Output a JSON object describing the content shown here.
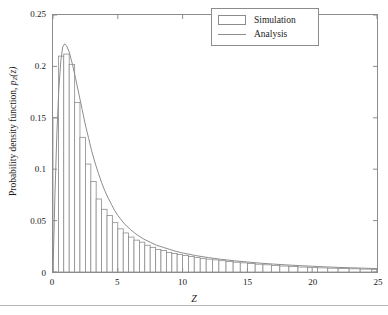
{
  "chart_data": {
    "type": "bar",
    "title": "",
    "subtitle": "",
    "xlabel": "Z",
    "ylabel": "Probability density function, p_Z(z)",
    "xlim": [
      0,
      25
    ],
    "ylim": [
      0,
      0.25
    ],
    "xticks": [
      0,
      5,
      10,
      15,
      20,
      25
    ],
    "xticklabels": [
      "0",
      "5",
      "10",
      "15",
      "20",
      "25"
    ],
    "yticks": [
      0,
      0.05,
      0.1,
      0.15,
      0.2,
      0.25
    ],
    "yticklabels": [
      "0",
      "0.05",
      "0.1",
      "0.15",
      "0.2",
      "0.25"
    ],
    "grid": false,
    "legend_position": "upper right",
    "legend": [
      "Simulation",
      "Analysis"
    ],
    "series": [
      {
        "name": "Simulation",
        "type": "bar",
        "style": "histogram-outline",
        "edge_color": "#8c8c8c",
        "fill_color": "#ffffff",
        "bins": [
          {
            "x0": 0.0,
            "x1": 0.42,
            "value": 0.15
          },
          {
            "x0": 0.42,
            "x1": 0.83,
            "value": 0.21
          },
          {
            "x0": 0.83,
            "x1": 1.25,
            "value": 0.212
          },
          {
            "x0": 1.25,
            "x1": 1.67,
            "value": 0.202
          },
          {
            "x0": 1.67,
            "x1": 2.08,
            "value": 0.165
          },
          {
            "x0": 2.08,
            "x1": 2.5,
            "value": 0.131
          },
          {
            "x0": 2.5,
            "x1": 2.92,
            "value": 0.105
          },
          {
            "x0": 2.92,
            "x1": 3.33,
            "value": 0.088
          },
          {
            "x0": 3.33,
            "x1": 3.75,
            "value": 0.071
          },
          {
            "x0": 3.75,
            "x1": 4.17,
            "value": 0.061
          },
          {
            "x0": 4.17,
            "x1": 4.58,
            "value": 0.055
          },
          {
            "x0": 4.58,
            "x1": 5.0,
            "value": 0.048
          },
          {
            "x0": 5.0,
            "x1": 5.42,
            "value": 0.042
          },
          {
            "x0": 5.42,
            "x1": 5.83,
            "value": 0.038
          },
          {
            "x0": 5.83,
            "x1": 6.25,
            "value": 0.034
          },
          {
            "x0": 6.25,
            "x1": 6.67,
            "value": 0.031
          },
          {
            "x0": 6.67,
            "x1": 7.08,
            "value": 0.029
          },
          {
            "x0": 7.08,
            "x1": 7.5,
            "value": 0.026
          },
          {
            "x0": 7.5,
            "x1": 7.92,
            "value": 0.024
          },
          {
            "x0": 7.92,
            "x1": 8.33,
            "value": 0.022
          },
          {
            "x0": 8.33,
            "x1": 8.75,
            "value": 0.021
          },
          {
            "x0": 8.75,
            "x1": 9.17,
            "value": 0.019
          },
          {
            "x0": 9.17,
            "x1": 9.58,
            "value": 0.018
          },
          {
            "x0": 9.58,
            "x1": 10.0,
            "value": 0.017
          },
          {
            "x0": 10.0,
            "x1": 10.45,
            "value": 0.016
          },
          {
            "x0": 10.45,
            "x1": 10.9,
            "value": 0.015
          },
          {
            "x0": 10.9,
            "x1": 11.36,
            "value": 0.014
          },
          {
            "x0": 11.36,
            "x1": 11.82,
            "value": 0.013
          },
          {
            "x0": 11.82,
            "x1": 12.3,
            "value": 0.0125
          },
          {
            "x0": 12.3,
            "x1": 12.8,
            "value": 0.0118
          },
          {
            "x0": 12.8,
            "x1": 13.35,
            "value": 0.011
          },
          {
            "x0": 13.35,
            "x1": 13.9,
            "value": 0.0102
          },
          {
            "x0": 13.9,
            "x1": 14.45,
            "value": 0.0095
          },
          {
            "x0": 14.45,
            "x1": 15.0,
            "value": 0.0089
          },
          {
            "x0": 15.0,
            "x1": 15.6,
            "value": 0.0082
          },
          {
            "x0": 15.6,
            "x1": 16.2,
            "value": 0.0076
          },
          {
            "x0": 16.2,
            "x1": 16.85,
            "value": 0.007
          },
          {
            "x0": 16.85,
            "x1": 17.5,
            "value": 0.0064
          },
          {
            "x0": 17.5,
            "x1": 18.2,
            "value": 0.0058
          },
          {
            "x0": 18.2,
            "x1": 18.9,
            "value": 0.0053
          },
          {
            "x0": 18.9,
            "x1": 19.65,
            "value": 0.0048
          },
          {
            "x0": 19.65,
            "x1": 20.4,
            "value": 0.0044
          },
          {
            "x0": 20.4,
            "x1": 21.2,
            "value": 0.004
          },
          {
            "x0": 21.2,
            "x1": 22.0,
            "value": 0.0037
          },
          {
            "x0": 22.0,
            "x1": 22.85,
            "value": 0.0034
          },
          {
            "x0": 22.85,
            "x1": 23.7,
            "value": 0.0031
          },
          {
            "x0": 23.7,
            "x1": 24.6,
            "value": 0.0028
          },
          {
            "x0": 24.6,
            "x1": 25.0,
            "value": 0.0026
          }
        ]
      },
      {
        "name": "Analysis",
        "type": "line",
        "color": "#8c8c8c",
        "points": [
          [
            0.0,
            0.0
          ],
          [
            0.15,
            0.075
          ],
          [
            0.3,
            0.135
          ],
          [
            0.45,
            0.178
          ],
          [
            0.6,
            0.205
          ],
          [
            0.75,
            0.219
          ],
          [
            0.9,
            0.222
          ],
          [
            1.05,
            0.22
          ],
          [
            1.25,
            0.214
          ],
          [
            1.5,
            0.202
          ],
          [
            1.75,
            0.188
          ],
          [
            2.0,
            0.173
          ],
          [
            2.25,
            0.158
          ],
          [
            2.5,
            0.143
          ],
          [
            2.75,
            0.13
          ],
          [
            3.0,
            0.117
          ],
          [
            3.25,
            0.106
          ],
          [
            3.5,
            0.096
          ],
          [
            3.75,
            0.087
          ],
          [
            4.0,
            0.079
          ],
          [
            4.25,
            0.072
          ],
          [
            4.5,
            0.066
          ],
          [
            4.75,
            0.06
          ],
          [
            5.0,
            0.055
          ],
          [
            5.5,
            0.047
          ],
          [
            6.0,
            0.041
          ],
          [
            6.5,
            0.036
          ],
          [
            7.0,
            0.032
          ],
          [
            7.5,
            0.029
          ],
          [
            8.0,
            0.026
          ],
          [
            8.5,
            0.024
          ],
          [
            9.0,
            0.022
          ],
          [
            9.5,
            0.02
          ],
          [
            10.0,
            0.0185
          ],
          [
            11.0,
            0.016
          ],
          [
            12.0,
            0.014
          ],
          [
            13.0,
            0.0123
          ],
          [
            14.0,
            0.0109
          ],
          [
            15.0,
            0.0097
          ],
          [
            16.0,
            0.0086
          ],
          [
            17.0,
            0.0077
          ],
          [
            18.0,
            0.0069
          ],
          [
            19.0,
            0.0062
          ],
          [
            20.0,
            0.0056
          ],
          [
            21.0,
            0.005
          ],
          [
            22.0,
            0.0045
          ],
          [
            23.0,
            0.0041
          ],
          [
            24.0,
            0.0037
          ],
          [
            25.0,
            0.0033
          ]
        ]
      }
    ]
  },
  "figure": {
    "axis_color": "#8c8c8c",
    "background": "#ffffff"
  }
}
